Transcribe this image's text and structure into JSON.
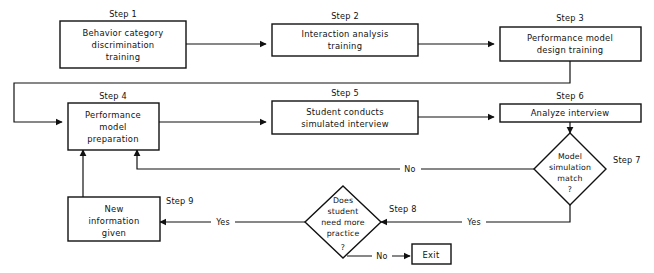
{
  "diagram": {
    "background_color": "#ffffff",
    "line_color": "#111111"
  },
  "nodes": [
    {
      "id": "step1",
      "step_label": "Step 1",
      "shape": "box",
      "lines": [
        "Behavior category",
        "discrimination",
        "training"
      ]
    },
    {
      "id": "step2",
      "step_label": "Step 2",
      "shape": "box",
      "lines": [
        "Interaction analysis",
        "training"
      ]
    },
    {
      "id": "step3",
      "step_label": "Step 3",
      "shape": "box",
      "lines": [
        "Performance model",
        "design training"
      ]
    },
    {
      "id": "step4",
      "step_label": "Step 4",
      "shape": "box",
      "lines": [
        "Performance",
        "model",
        "preparation"
      ]
    },
    {
      "id": "step5",
      "step_label": "Step 5",
      "shape": "box",
      "lines": [
        "Student conducts",
        "simulated interview"
      ]
    },
    {
      "id": "step6",
      "step_label": "Step 6",
      "shape": "box",
      "lines": [
        "Analyze interview"
      ]
    },
    {
      "id": "step7",
      "step_label": "Step 7",
      "shape": "diamond",
      "lines": [
        "Model",
        "simulation",
        "match",
        "?"
      ]
    },
    {
      "id": "step8",
      "step_label": "Step 8",
      "shape": "diamond",
      "lines": [
        "Does",
        "student",
        "need more",
        "practice",
        "?"
      ]
    },
    {
      "id": "step9",
      "step_label": "Step 9",
      "shape": "box",
      "lines": [
        "New",
        "information",
        "given"
      ]
    },
    {
      "id": "exit",
      "step_label": "",
      "shape": "box",
      "lines": [
        "Exit"
      ]
    }
  ],
  "edges": [
    {
      "id": "e1",
      "from": "step1",
      "to": "step2",
      "label": ""
    },
    {
      "id": "e2",
      "from": "step2",
      "to": "step3",
      "label": ""
    },
    {
      "id": "e3",
      "from": "step3",
      "to": "step4",
      "label": ""
    },
    {
      "id": "e4",
      "from": "step4",
      "to": "step5",
      "label": ""
    },
    {
      "id": "e5",
      "from": "step5",
      "to": "step6",
      "label": ""
    },
    {
      "id": "e6",
      "from": "step6",
      "to": "step7",
      "label": ""
    },
    {
      "id": "e7",
      "from": "step7",
      "to": "step4",
      "label": "No"
    },
    {
      "id": "e8",
      "from": "step7",
      "to": "step8",
      "label": "Yes"
    },
    {
      "id": "e9",
      "from": "step8",
      "to": "step9",
      "label": "Yes"
    },
    {
      "id": "e10",
      "from": "step8",
      "to": "exit",
      "label": "No"
    },
    {
      "id": "e11",
      "from": "step9",
      "to": "step4",
      "label": ""
    }
  ]
}
